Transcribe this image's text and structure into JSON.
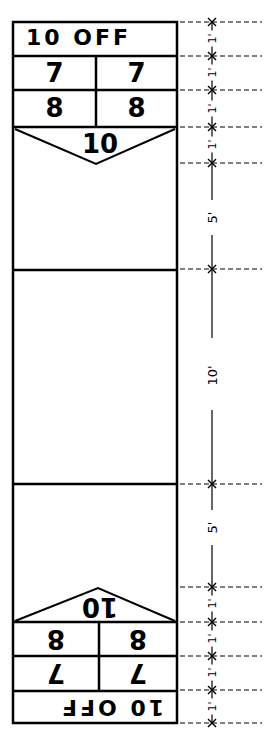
{
  "diagram": {
    "top_end": {
      "off_label": "10 OFF",
      "row_7": [
        "7",
        "7"
      ],
      "row_8": [
        "8",
        "8"
      ],
      "triangle_label": "10"
    },
    "bottom_end": {
      "off_label": "10 OFF",
      "row_7": [
        "7",
        "7"
      ],
      "row_8": [
        "8",
        "8"
      ],
      "triangle_label": "10",
      "orientation": "rotated 180°"
    },
    "dimensions": [
      {
        "segment": "10 OFF (top)",
        "label": "1'"
      },
      {
        "segment": "7 row (top)",
        "label": "1'"
      },
      {
        "segment": "8 row (top)",
        "label": "1'"
      },
      {
        "segment": "10 triangle (top)",
        "label": "1'"
      },
      {
        "segment": "upper zone",
        "label": "5'"
      },
      {
        "segment": "center zone",
        "label": "10'"
      },
      {
        "segment": "lower zone",
        "label": "5'"
      },
      {
        "segment": "10 triangle (bottom)",
        "label": "1'"
      },
      {
        "segment": "8 row (bottom)",
        "label": "1'"
      },
      {
        "segment": "7 row (bottom)",
        "label": "1'"
      },
      {
        "segment": "10 OFF (bottom)",
        "label": "1'"
      }
    ],
    "colors": {
      "line": "#000000",
      "background": "#ffffff"
    }
  }
}
